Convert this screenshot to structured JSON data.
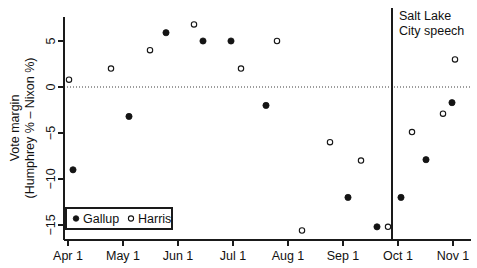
{
  "chart_data": {
    "type": "scatter",
    "title": "",
    "xlabel": "",
    "ylabel": "Vote margin (Humphrey % − Nixon %)",
    "ylabel_line1": "Vote margin",
    "ylabel_line2": "(Humphrey % – Nixon %)",
    "ylim": [
      -16.5,
      7.5
    ],
    "yticks": [
      5,
      0,
      -5,
      -10,
      -15
    ],
    "ytick_labels": [
      "5",
      "0",
      "−5",
      "−10",
      "−15"
    ],
    "xticks": [
      "Apr 1",
      "May 1",
      "Jun 1",
      "Jul 1",
      "Aug 1",
      "Sep 1",
      "Oct 1",
      "Nov 1"
    ],
    "xtick_positions_px": [
      68,
      123,
      178,
      233,
      288,
      343,
      398,
      453
    ],
    "grid": false,
    "zero_reference_line": true,
    "legend_position": "bottom-left",
    "annotations": [
      {
        "name": "salt-lake-city-speech",
        "line1": "Salt Lake",
        "line2": "City speech",
        "x_px": 392,
        "type": "vertical-event-line"
      }
    ],
    "series": [
      {
        "name": "Gallup",
        "marker": "filled-circle",
        "color": "#141414",
        "points": [
          {
            "x_px": 73,
            "value": -9.0
          },
          {
            "x_px": 129,
            "value": -3.2
          },
          {
            "x_px": 166,
            "value": 5.9
          },
          {
            "x_px": 203,
            "value": 5.0
          },
          {
            "x_px": 231,
            "value": 5.0
          },
          {
            "x_px": 266,
            "value": -2.0
          },
          {
            "x_px": 348,
            "value": -12.0
          },
          {
            "x_px": 377,
            "value": -15.2
          },
          {
            "x_px": 401,
            "value": -12.0
          },
          {
            "x_px": 426,
            "value": -7.9
          },
          {
            "x_px": 452,
            "value": -1.7
          }
        ]
      },
      {
        "name": "Harris",
        "marker": "open-circle",
        "color": "#141414",
        "points": [
          {
            "x_px": 69,
            "value": 0.8
          },
          {
            "x_px": 111,
            "value": 2.0
          },
          {
            "x_px": 150,
            "value": 4.0
          },
          {
            "x_px": 194,
            "value": 6.8
          },
          {
            "x_px": 241,
            "value": 2.0
          },
          {
            "x_px": 277,
            "value": 5.0
          },
          {
            "x_px": 302,
            "value": -15.6
          },
          {
            "x_px": 330,
            "value": -6.0
          },
          {
            "x_px": 361,
            "value": -8.0
          },
          {
            "x_px": 388,
            "value": -15.2
          },
          {
            "x_px": 412,
            "value": -4.9
          },
          {
            "x_px": 443,
            "value": -2.9
          },
          {
            "x_px": 455,
            "value": 3.0
          }
        ]
      }
    ]
  },
  "legend": {
    "entries": [
      {
        "label": "Gallup",
        "marker": "filled-circle"
      },
      {
        "label": "Harris",
        "marker": "open-circle"
      }
    ]
  }
}
